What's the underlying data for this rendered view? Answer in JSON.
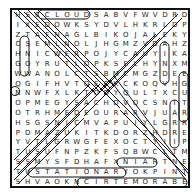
{
  "puzzle": {
    "type": "word-search",
    "rows": 18,
    "cols": 18,
    "grid": [
      "HSCCLOUDSABVFWVDRD",
      "IXEDOWKSYDVLHKRLDP",
      "ZTAFNAGLBIKOJALEKY",
      "CSEMLNOLJHGMZVDAHZ",
      "HNICWERPOJYCAUYIKA",
      "GOYRUTLOPKSELHYNXM",
      "WWANOLCTSBMCMGZDEE",
      "QGIFHVTOECKCKOQVHG",
      "NNWFXLKTODYQULTXCU",
      "OPMEGYSACHDVQCSNIT",
      "OTRHMEDEOURARVJUAR",
      "HSGSNICMVAPUIYLGRR",
      "PDMAZUKITKDORZHDRE",
      "YVTLGRWGFEXOCTYIIP",
      "TUSUFNPZKFSQBWCLTM",
      "SSMYSFDHAFXNIARTNE",
      "TUSTATIONARYOKPINT",
      "SHVAOKNCIRTEMORABE"
    ],
    "found_words": [
      "CLOUDS",
      "RAIN",
      "STATIONARY",
      "BAROMETRIC"
    ]
  }
}
